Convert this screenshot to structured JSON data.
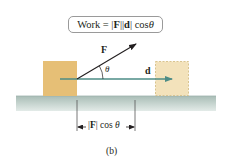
{
  "formula": {
    "prefix": "Work = |",
    "F": "F",
    "mid": "||",
    "d": "d",
    "suffix": "| cos ",
    "theta": "θ"
  },
  "labels": {
    "force": "F",
    "displacement": "d",
    "angle": "θ",
    "projection_prefix": "|",
    "projection_F": "F",
    "projection_suffix": "| cos ",
    "projection_theta": "θ",
    "caption": "(b)"
  },
  "colors": {
    "block_start": "#e6bf76",
    "block_end": "#f3e2bb",
    "block_end_border": "#d9c48f",
    "ground_top": "#a9bdb6",
    "ground_bottom": "#dbe5e1",
    "displacement_arrow": "#4d8c86",
    "force_arrow": "#231f20",
    "formula_border": "#9a9a9a"
  }
}
